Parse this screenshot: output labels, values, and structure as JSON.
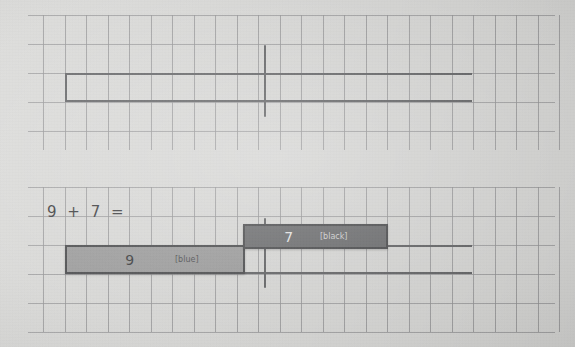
{
  "page": {
    "background_color": "#d8d8d6",
    "grid_color": "#8d8d8f",
    "ink_color": "#5a5b5d"
  },
  "equation": {
    "text": "9 + 7 ="
  },
  "top_model": {
    "label": "empty total bar",
    "bar": {
      "name": "total-bar",
      "value": "",
      "fill": "none",
      "left": 65,
      "top": 73,
      "width": 407,
      "height": 29
    },
    "tick": {
      "name": "midpoint-tick",
      "left": 264,
      "top": 45,
      "height": 72
    }
  },
  "bottom_model": {
    "bars": [
      {
        "name": "addend-bar-9",
        "value": "9",
        "tag": "[blue]",
        "color_name": "blue",
        "fill": "#979797",
        "left": 65,
        "top": 245,
        "width": 180,
        "height": 29
      },
      {
        "name": "addend-bar-7",
        "value": "7",
        "tag": "[black]",
        "color_name": "black",
        "fill": "#636466",
        "left": 243,
        "top": 224,
        "width": 145,
        "height": 25
      }
    ],
    "total_outline": {
      "name": "total-outline",
      "left": 65,
      "top": 245,
      "width": 407,
      "height": 29
    },
    "tick": {
      "name": "midpoint-tick",
      "left": 264,
      "top": 218,
      "height": 70
    }
  },
  "grid": {
    "cell_width": 21.5,
    "cell_height": 29,
    "v_start_x": 43,
    "v_count": 25,
    "bands": [
      {
        "name": "top-grid-band",
        "top": 15,
        "height": 135,
        "h_lines": [
          15,
          44,
          73,
          102,
          131
        ]
      },
      {
        "name": "bottom-grid-band",
        "top": 187,
        "height": 145,
        "h_lines": [
          187,
          216,
          245,
          274,
          303,
          332
        ]
      }
    ]
  }
}
